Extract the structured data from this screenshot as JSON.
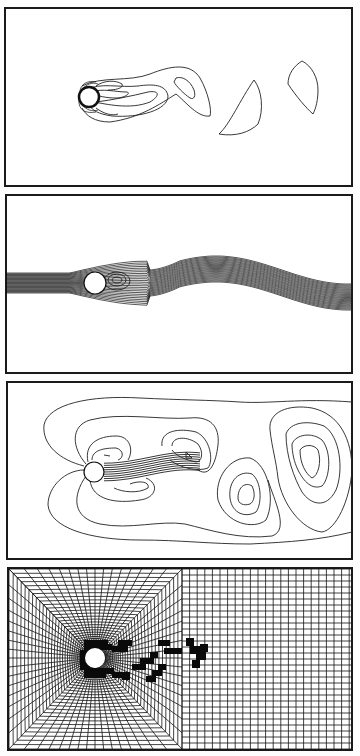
{
  "figure": {
    "panels": [
      {
        "id": "vorticity",
        "kind": "vorticity contours",
        "label": ""
      },
      {
        "id": "streaklines",
        "kind": "streakline / stream pattern",
        "label": ""
      },
      {
        "id": "pressure",
        "kind": "pressure contours",
        "label": ""
      },
      {
        "id": "mesh",
        "kind": "adaptive computational mesh with refined cells",
        "label": ""
      }
    ],
    "colors": {
      "ink": "#111111",
      "background": "#ffffff"
    }
  }
}
